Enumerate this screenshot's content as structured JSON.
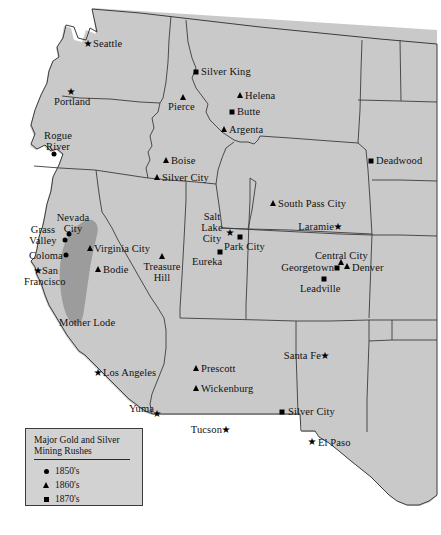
{
  "map": {
    "title": "Major Gold and Silver Mining Rushes",
    "region_label": "Mother Lode",
    "land_color": "#c9c9c9",
    "shade_color": "#9a9a9a",
    "border_color": "#3c3c3c",
    "background_color": "#ffffff"
  },
  "legend": {
    "title_line1": "Major Gold and Silver",
    "title_line2": "Mining Rushes",
    "entries": [
      {
        "icon": "circle-marker",
        "label": "1850's"
      },
      {
        "icon": "triangle-marker",
        "label": "1860's"
      },
      {
        "icon": "square-marker",
        "label": "1870's"
      }
    ]
  },
  "places": [
    {
      "name": "Seattle",
      "label": "Seattle",
      "marker": "star"
    },
    {
      "name": "Portland",
      "label": "Portland",
      "marker": "star"
    },
    {
      "name": "Rogue River",
      "label": "Rogue\nRiver",
      "marker": "circle"
    },
    {
      "name": "Silver King",
      "label": "Silver King",
      "marker": "square"
    },
    {
      "name": "Pierce",
      "label": "Pierce",
      "marker": "triangle"
    },
    {
      "name": "Helena",
      "label": "Helena",
      "marker": "triangle"
    },
    {
      "name": "Butte",
      "label": "Butte",
      "marker": "square"
    },
    {
      "name": "Argenta",
      "label": "Argenta",
      "marker": "triangle"
    },
    {
      "name": "Boise",
      "label": "Boise",
      "marker": "triangle"
    },
    {
      "name": "Silver City ID",
      "label": "Silver City",
      "marker": "triangle"
    },
    {
      "name": "Deadwood",
      "label": "Deadwood",
      "marker": "square"
    },
    {
      "name": "South Pass City",
      "label": "South Pass City",
      "marker": "triangle"
    },
    {
      "name": "Laramie",
      "label": "Laramie",
      "marker": "star"
    },
    {
      "name": "Salt Lake City",
      "label": "Salt Lake\nCity",
      "marker": "star"
    },
    {
      "name": "Park City",
      "label": "Park City",
      "marker": "square"
    },
    {
      "name": "Eureka",
      "label": "Eureka",
      "marker": "square"
    },
    {
      "name": "Central City",
      "label": "Central City",
      "marker": "triangle"
    },
    {
      "name": "Georgetown",
      "label": "Georgetown",
      "marker": "square"
    },
    {
      "name": "Denver",
      "label": "Denver",
      "marker": "triangle"
    },
    {
      "name": "Leadville",
      "label": "Leadville",
      "marker": "square"
    },
    {
      "name": "Nevada City",
      "label": "Nevada\nCity",
      "marker": "circle"
    },
    {
      "name": "Grass Valley",
      "label": "Grass\nValley",
      "marker": "circle"
    },
    {
      "name": "Coloma",
      "label": "Coloma",
      "marker": "circle"
    },
    {
      "name": "San Francisco",
      "label": "San\nFrancisco",
      "marker": "star"
    },
    {
      "name": "Virginia City",
      "label": "Virginia City",
      "marker": "triangle"
    },
    {
      "name": "Bodie",
      "label": "Bodie",
      "marker": "triangle"
    },
    {
      "name": "Treasure Hill",
      "label": "Treasure\nHill",
      "marker": "triangle"
    },
    {
      "name": "Mother Lode",
      "label": "Mother Lode",
      "marker": "none"
    },
    {
      "name": "Los Angeles",
      "label": "Los Angeles",
      "marker": "star"
    },
    {
      "name": "Prescott",
      "label": "Prescott",
      "marker": "triangle"
    },
    {
      "name": "Wickenburg",
      "label": "Wickenburg",
      "marker": "triangle"
    },
    {
      "name": "Santa Fe",
      "label": "Santa Fe",
      "marker": "star"
    },
    {
      "name": "Yuma",
      "label": "Yuma",
      "marker": "star"
    },
    {
      "name": "Tucson",
      "label": "Tucson",
      "marker": "star"
    },
    {
      "name": "Silver City NM",
      "label": "Silver City",
      "marker": "square"
    },
    {
      "name": "El Paso",
      "label": "El Paso",
      "marker": "star"
    }
  ],
  "labels": {
    "seattle": "Seattle",
    "portland": "Portland",
    "rogue_river_l1": "Rogue",
    "rogue_river_l2": "River",
    "silver_king": "Silver King",
    "pierce": "Pierce",
    "helena": "Helena",
    "butte": "Butte",
    "argenta": "Argenta",
    "boise": "Boise",
    "silver_city_id": "Silver City",
    "deadwood": "Deadwood",
    "south_pass_city": "South Pass City",
    "laramie": "Laramie",
    "salt_lake_city_l1": "Salt Lake",
    "salt_lake_city_l2": "City",
    "park_city": "Park City",
    "eureka": "Eureka",
    "central_city": "Central City",
    "georgetown": "Georgetown",
    "denver": "Denver",
    "leadville": "Leadville",
    "nevada_city_l1": "Nevada",
    "nevada_city_l2": "City",
    "grass_valley_l1": "Grass",
    "grass_valley_l2": "Valley",
    "coloma": "Coloma",
    "san_francisco_l1": "San",
    "san_francisco_l2": "Francisco",
    "virginia_city": "Virginia City",
    "bodie": "Bodie",
    "treasure_hill_l1": "Treasure",
    "treasure_hill_l2": "Hill",
    "mother_lode": "Mother Lode",
    "los_angeles": "Los Angeles",
    "prescott": "Prescott",
    "wickenburg": "Wickenburg",
    "santa_fe": "Santa Fe",
    "yuma": "Yuma",
    "tucson": "Tucson",
    "silver_city_nm": "Silver City",
    "el_paso": "El Paso"
  }
}
